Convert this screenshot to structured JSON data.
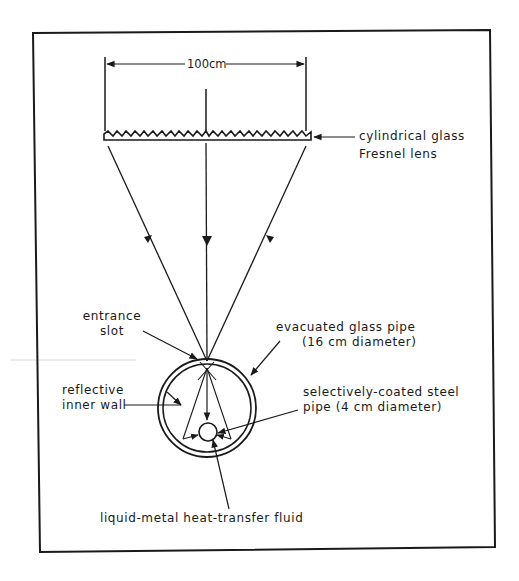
{
  "diagram": {
    "type": "Solar concentrator schematic",
    "dimension": {
      "label": "100cm"
    },
    "labels": {
      "lens_line1": "cylindrical glass",
      "lens_line2": "Fresnel lens",
      "slot_line1": "entrance",
      "slot_line2": "slot",
      "glass_pipe_line1": "evacuated glass pipe",
      "glass_pipe_line2": "(16 cm diameter)",
      "wall_line1": "reflective",
      "wall_line2": "inner wall",
      "steel_pipe_line1": "selectively-coated steel",
      "steel_pipe_line2": "pipe (4 cm diameter)",
      "fluid": "liquid-metal heat-transfer fluid"
    },
    "components": [
      {
        "name": "cylindrical glass Fresnel lens",
        "width": "100 cm"
      },
      {
        "name": "entrance slot"
      },
      {
        "name": "evacuated glass pipe",
        "diameter": "16 cm"
      },
      {
        "name": "reflective inner wall"
      },
      {
        "name": "selectively-coated steel pipe",
        "diameter": "4 cm"
      },
      {
        "name": "liquid-metal heat-transfer fluid"
      }
    ],
    "colors": {
      "ink": "#1a1a1a",
      "background": "#ffffff"
    }
  }
}
